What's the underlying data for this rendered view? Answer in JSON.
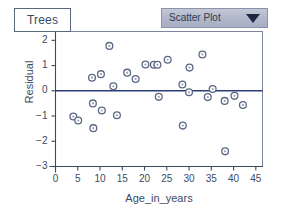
{
  "window": {
    "title_tab": "Trees",
    "background": "#ffffff"
  },
  "plot_type_select": {
    "selected": "Scatter Plot",
    "caret": "chevron-down-icon",
    "options": [
      "Scatter Plot"
    ]
  },
  "colors": {
    "axis": "#3b4a63",
    "frame": "#7b859c",
    "zero_line": "#2d3a7a",
    "marker_stroke": "#5b6883",
    "marker_fill": "#9aa3b8",
    "select_face": "#b3b9cb",
    "text": "#3b4a63"
  },
  "chart_data": {
    "type": "scatter",
    "title": "",
    "xlabel": "Age_in_years",
    "ylabel": "Residual",
    "xlim": [
      0,
      46.5
    ],
    "ylim": [
      -3,
      2.35
    ],
    "xticks": [
      0,
      5,
      10,
      15,
      20,
      25,
      30,
      35,
      40,
      45
    ],
    "xtick_labels": [
      "0",
      "5",
      "10",
      "15",
      "20",
      "25",
      "30",
      "35",
      "40",
      "45"
    ],
    "yticks": [
      2,
      1,
      0,
      -1,
      -2,
      -3
    ],
    "ytick_labels": [
      "2",
      "1",
      "0",
      "−1",
      "−2",
      "−3"
    ],
    "grid": false,
    "legend": false,
    "reference_line": {
      "axis": "y",
      "value": 0,
      "color": "#2d3a7a"
    },
    "marker": {
      "shape": "circle",
      "size": 3.4,
      "filled": false
    },
    "points": [
      {
        "x": 4.0,
        "y": -1.02
      },
      {
        "x": 5.1,
        "y": -1.18
      },
      {
        "x": 8.2,
        "y": 0.52
      },
      {
        "x": 8.4,
        "y": -0.5
      },
      {
        "x": 8.5,
        "y": -1.48
      },
      {
        "x": 10.2,
        "y": 0.66
      },
      {
        "x": 10.4,
        "y": -0.78
      },
      {
        "x": 12.1,
        "y": 1.78
      },
      {
        "x": 13.0,
        "y": 0.18
      },
      {
        "x": 13.8,
        "y": -0.97
      },
      {
        "x": 16.1,
        "y": 0.72
      },
      {
        "x": 18.0,
        "y": 0.47
      },
      {
        "x": 20.2,
        "y": 1.04
      },
      {
        "x": 22.1,
        "y": 1.03
      },
      {
        "x": 22.9,
        "y": 1.03
      },
      {
        "x": 23.2,
        "y": -0.24
      },
      {
        "x": 25.2,
        "y": 1.23
      },
      {
        "x": 28.5,
        "y": 0.25
      },
      {
        "x": 28.6,
        "y": -1.38
      },
      {
        "x": 30.0,
        "y": -0.06
      },
      {
        "x": 30.1,
        "y": 0.92
      },
      {
        "x": 33.0,
        "y": 1.44
      },
      {
        "x": 34.2,
        "y": -0.25
      },
      {
        "x": 35.3,
        "y": 0.07
      },
      {
        "x": 38.0,
        "y": -0.4
      },
      {
        "x": 38.1,
        "y": -2.4
      },
      {
        "x": 40.2,
        "y": -0.2
      },
      {
        "x": 42.1,
        "y": -0.56
      }
    ]
  }
}
